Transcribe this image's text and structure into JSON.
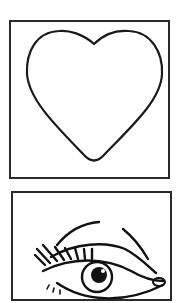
{
  "cards": [
    {
      "id": "heart",
      "icon": "heart-outline-icon",
      "label": "Heart"
    },
    {
      "id": "eye",
      "icon": "eye-with-lashes-icon",
      "label": "Eye"
    }
  ],
  "colors": {
    "stroke": "#1a1a1a",
    "border": "#2a2a2a",
    "background": "#ffffff"
  }
}
